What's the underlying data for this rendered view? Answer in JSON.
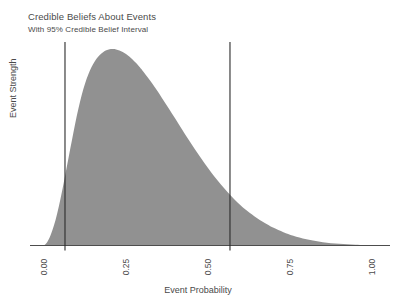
{
  "chart_data": {
    "type": "area",
    "title": "Credible Beliefs About Events",
    "subtitle": "With 95% Credible Belief Interval",
    "xlabel": "Event Probability",
    "ylabel": "Event Strength",
    "xlim": [
      0.0,
      1.0
    ],
    "ylim": [
      0.0,
      1.0
    ],
    "xticks": [
      0.0,
      0.25,
      0.5,
      0.75,
      1.0
    ],
    "xtick_labels": [
      "0.00",
      "0.25",
      "0.50",
      "0.75",
      "1.00"
    ],
    "ytick_labels": [],
    "grid": false,
    "legend": null,
    "fill_color": "#919191",
    "line_color": "#333333",
    "series": [
      {
        "name": "posterior density",
        "x": [
          0.0,
          0.01,
          0.02,
          0.03,
          0.04,
          0.05,
          0.06,
          0.07,
          0.08,
          0.09,
          0.1,
          0.11,
          0.12,
          0.13,
          0.14,
          0.15,
          0.16,
          0.17,
          0.18,
          0.19,
          0.2,
          0.21,
          0.22,
          0.23,
          0.24,
          0.25,
          0.26,
          0.27,
          0.28,
          0.29,
          0.3,
          0.32,
          0.34,
          0.36,
          0.38,
          0.4,
          0.42,
          0.44,
          0.46,
          0.48,
          0.5,
          0.52,
          0.54,
          0.56,
          0.58,
          0.6,
          0.62,
          0.65,
          0.68,
          0.7,
          0.73,
          0.76,
          0.8,
          0.85,
          0.9,
          0.95,
          1.0
        ],
        "y": [
          0.0,
          0.018,
          0.052,
          0.1,
          0.162,
          0.236,
          0.318,
          0.404,
          0.492,
          0.578,
          0.66,
          0.733,
          0.796,
          0.849,
          0.891,
          0.924,
          0.95,
          0.97,
          0.984,
          0.994,
          0.999,
          1.0,
          0.998,
          0.993,
          0.985,
          0.975,
          0.962,
          0.947,
          0.93,
          0.911,
          0.891,
          0.847,
          0.8,
          0.75,
          0.699,
          0.646,
          0.593,
          0.541,
          0.49,
          0.441,
          0.394,
          0.35,
          0.309,
          0.271,
          0.236,
          0.204,
          0.176,
          0.139,
          0.108,
          0.09,
          0.068,
          0.05,
          0.032,
          0.017,
          0.009,
          0.004,
          0.002
        ]
      }
    ],
    "annotations": [
      {
        "name": "credible-interval-lower",
        "type": "vline",
        "x": 0.064,
        "label": "95% CI lower bound"
      },
      {
        "name": "credible-interval-upper",
        "type": "vline",
        "x": 0.567,
        "label": "95% CI upper bound"
      }
    ],
    "credible_interval": {
      "level": "95%",
      "lower": 0.064,
      "upper": 0.567
    }
  }
}
